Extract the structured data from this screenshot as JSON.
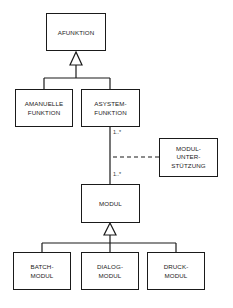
{
  "diagram": {
    "type": "UML class hierarchy",
    "nodes": {
      "afunktion": {
        "lines": [
          "AFUNKTION"
        ]
      },
      "amanuelle": {
        "lines": [
          "AMANUELLE",
          "FUNKTION"
        ]
      },
      "asystem": {
        "lines": [
          "ASYSTEM-",
          "FUNKTION"
        ]
      },
      "modulunterstuetzung": {
        "lines": [
          "MODUL-",
          "UNTER-",
          "STÜTZUNG"
        ]
      },
      "modul": {
        "lines": [
          "MODUL"
        ]
      },
      "batch": {
        "lines": [
          "BATCH-",
          "MODUL"
        ]
      },
      "dialog": {
        "lines": [
          "DIALOG-",
          "MODUL"
        ]
      },
      "druck": {
        "lines": [
          "DRUCK-",
          "MODUL"
        ]
      }
    },
    "multiplicities": {
      "asystem_end": "1..*",
      "modul_end": "1..*"
    },
    "edges": [
      {
        "from": "amanuelle",
        "to": "afunktion",
        "kind": "generalization"
      },
      {
        "from": "asystem",
        "to": "afunktion",
        "kind": "generalization"
      },
      {
        "from": "asystem",
        "to": "modul",
        "kind": "association"
      },
      {
        "from": "modulunterstuetzung",
        "to": "asystem-modul",
        "kind": "association-class (dashed)"
      },
      {
        "from": "batch",
        "to": "modul",
        "kind": "generalization"
      },
      {
        "from": "dialog",
        "to": "modul",
        "kind": "generalization"
      },
      {
        "from": "druck",
        "to": "modul",
        "kind": "generalization"
      }
    ],
    "colors": {
      "line": "#1a1a1a",
      "background": "#ffffff"
    }
  }
}
